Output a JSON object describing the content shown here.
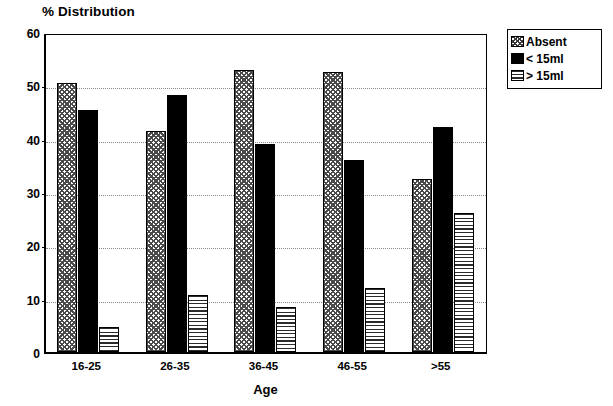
{
  "chart_data": {
    "type": "bar",
    "title": "% Distribution",
    "subtitle": "",
    "xlabel": "Age",
    "ylabel": "% Distribution",
    "categories": [
      "16-25",
      "26-35",
      "36-45",
      "46-55",
      ">55"
    ],
    "series": [
      {
        "name": "Absent",
        "pattern": "crosshatch",
        "color": "#ffffff",
        "values": [
          50.5,
          41.5,
          52.8,
          52.5,
          32.5
        ]
      },
      {
        "name": "< 15ml",
        "pattern": "solid",
        "color": "#000000",
        "values": [
          45.3,
          48.2,
          39.0,
          36.0,
          42.2
        ]
      },
      {
        "name": "> 15ml",
        "pattern": "horizontal-lines",
        "color": "#ffffff",
        "values": [
          4.6,
          10.6,
          8.4,
          12.0,
          26.0
        ]
      }
    ],
    "ylim": [
      0,
      60
    ],
    "yticks": [
      0,
      10,
      20,
      30,
      40,
      50,
      60
    ],
    "ytick_labels": [
      "0",
      "10",
      "20",
      "30",
      "40",
      "50",
      "60"
    ],
    "grid": true,
    "grid_axis": "y",
    "grid_style": "dotted",
    "legend_position": "outside-top-right",
    "legend": [
      "Absent",
      "< 15ml",
      "> 15ml"
    ]
  },
  "legend": {
    "items": [
      {
        "label": "Absent",
        "swatch": "crosshatch-swatch"
      },
      {
        "label": "< 15ml",
        "swatch": "solid-black-swatch"
      },
      {
        "label": "> 15ml",
        "swatch": "horizontal-lines-swatch"
      }
    ]
  }
}
